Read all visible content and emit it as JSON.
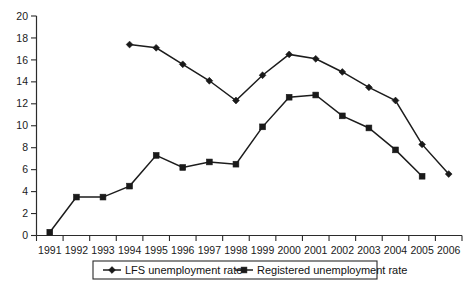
{
  "chart_data": {
    "type": "line",
    "title": "",
    "subtitle": "",
    "xlabel": "",
    "ylabel": "",
    "ylim": [
      0,
      20
    ],
    "ytick_step": 2,
    "yticks": [
      "0",
      "2",
      "4",
      "6",
      "8",
      "10",
      "12",
      "14",
      "16",
      "18",
      "20"
    ],
    "grid": false,
    "legend_position": "bottom",
    "categories": [
      "1991",
      "1992",
      "1993",
      "1994",
      "1995",
      "1996",
      "1997",
      "1998",
      "1999",
      "2000",
      "2001",
      "2002",
      "2003",
      "2004",
      "2005",
      "2006"
    ],
    "series": [
      {
        "name": "LFS unemployment rate",
        "marker": "diamond",
        "color": "#1a1a1a",
        "values": [
          null,
          null,
          null,
          17.4,
          17.1,
          15.6,
          14.1,
          12.3,
          14.6,
          16.5,
          16.1,
          14.9,
          13.5,
          12.3,
          8.3,
          5.6
        ]
      },
      {
        "name": "Registered unemployment rate",
        "marker": "square",
        "color": "#1a1a1a",
        "values": [
          0.3,
          3.5,
          3.5,
          4.5,
          7.3,
          6.2,
          6.7,
          6.5,
          9.9,
          12.6,
          12.8,
          10.9,
          9.8,
          7.8,
          5.4,
          null
        ]
      }
    ]
  },
  "legend": {
    "entries": [
      {
        "label": "LFS unemployment rate",
        "marker": "diamond"
      },
      {
        "label": "Registered unemployment rate",
        "marker": "square"
      }
    ]
  }
}
